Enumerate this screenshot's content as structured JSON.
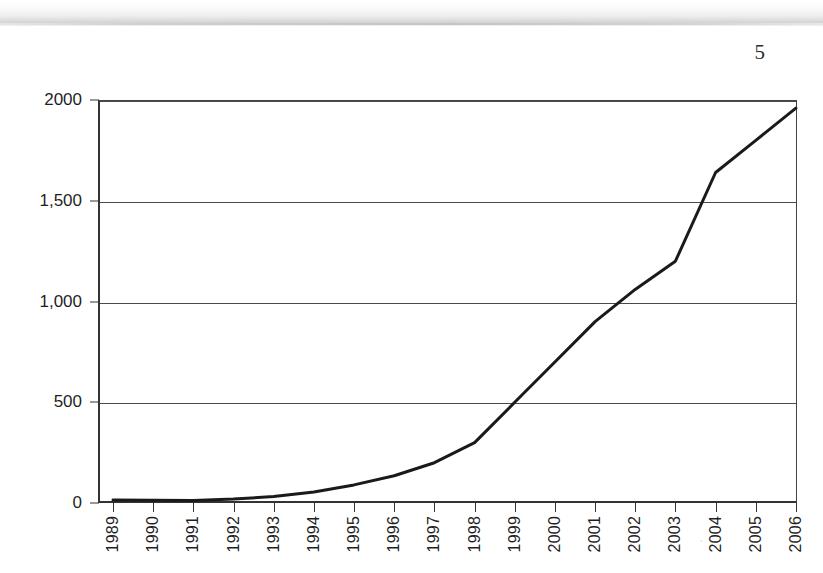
{
  "page": {
    "number": "5",
    "background_color": "#ffffff",
    "ink_color": "#1a1a1a"
  },
  "chart_data": {
    "type": "line",
    "title": "",
    "subtitle": "",
    "xlabel": "",
    "ylabel": "",
    "categories": [
      "1989",
      "1990",
      "1991",
      "1992",
      "1993",
      "1994",
      "1995",
      "1996",
      "1997",
      "1998",
      "1999",
      "2000",
      "2001",
      "2002",
      "2003",
      "2004",
      "2005",
      "2006"
    ],
    "series": [
      {
        "name": "series-1",
        "color": "#1a1a1a",
        "values": [
          15,
          14,
          13,
          20,
          32,
          55,
          90,
          135,
          200,
          300,
          500,
          700,
          900,
          1060,
          1200,
          1640,
          1800,
          1960
        ]
      }
    ],
    "ytick_values": [
      0,
      500,
      1000,
      1500,
      2000
    ],
    "ytick_labels": [
      "0",
      "500",
      "1,000",
      "1,500",
      "2000"
    ],
    "ylim": [
      0,
      2000
    ],
    "xlim_index": [
      0,
      17
    ],
    "grid": "horizontal",
    "legend": "none",
    "marker": "none",
    "line_width": 3
  }
}
